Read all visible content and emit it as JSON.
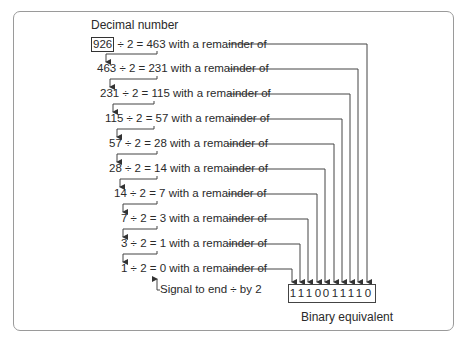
{
  "title": "Decimal number",
  "divisions": [
    {
      "dividend": "926",
      "divisor": "2",
      "quotient": "463",
      "suffix": "with a remainder of",
      "boxed": true
    },
    {
      "dividend": "463",
      "divisor": "2",
      "quotient": "231",
      "suffix": "with a remainder of"
    },
    {
      "dividend": "231",
      "divisor": "2",
      "quotient": "115",
      "suffix": "with a remainder of"
    },
    {
      "dividend": "115",
      "divisor": "2",
      "quotient": "57",
      "suffix": "with a remainder of"
    },
    {
      "dividend": "57",
      "divisor": "2",
      "quotient": "28",
      "suffix": "with a remainder of"
    },
    {
      "dividend": "28",
      "divisor": "2",
      "quotient": "14",
      "suffix": "with a remainder of"
    },
    {
      "dividend": "14",
      "divisor": "2",
      "quotient": "7",
      "suffix": "with a remainder of"
    },
    {
      "dividend": "7",
      "divisor": "2",
      "quotient": "3",
      "suffix": "with a remainder of"
    },
    {
      "dividend": "3",
      "divisor": "2",
      "quotient": "1",
      "suffix": "with a remainder of"
    },
    {
      "dividend": "1",
      "divisor": "2",
      "quotient": "0",
      "suffix": "with a remainder of"
    }
  ],
  "operators": {
    "divide": "÷",
    "equals": "="
  },
  "signal_note": "Signal to end ÷ by 2",
  "binary": {
    "digits": [
      "1",
      "1",
      "1",
      "0",
      "0",
      "1",
      "1",
      "1",
      "1",
      "0"
    ],
    "label": "Binary equivalent"
  }
}
